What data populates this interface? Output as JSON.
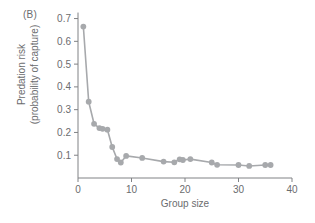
{
  "figure": {
    "panel_label": "(B)",
    "accent_color": "#a7a9ac",
    "axis_color": "#808285",
    "text_color": "#6b6c6e",
    "background": "#ffffff"
  },
  "chart_data": {
    "type": "line",
    "title": "",
    "panel": "(B)",
    "xlabel": "Group size",
    "ylabel_line1": "Predation risk",
    "ylabel_line2": "(probability of capture)",
    "xlim": [
      0,
      40
    ],
    "ylim": [
      0.0,
      0.72
    ],
    "xticks": [
      0,
      10,
      20,
      30,
      40
    ],
    "xtick_labels": [
      "0",
      "10",
      "20",
      "30",
      "40"
    ],
    "yticks": [
      0.1,
      0.2,
      0.3,
      0.4,
      0.5,
      0.6,
      0.7
    ],
    "ytick_labels": [
      "0.1",
      "0.2",
      "0.3",
      "0.4",
      "0.5",
      "0.6",
      "0.7"
    ],
    "grid": false,
    "legend": null,
    "marker": "circle",
    "series": [
      {
        "name": "Predation risk",
        "color": "#a7a9ac",
        "x": [
          1,
          2,
          3,
          4,
          4.6,
          5.5,
          6.4,
          7.3,
          8,
          9,
          12,
          16,
          18,
          19,
          19.6,
          21,
          25,
          26,
          30,
          32,
          35,
          36
        ],
        "y": [
          0.665,
          0.335,
          0.238,
          0.219,
          0.216,
          0.212,
          0.136,
          0.083,
          0.068,
          0.097,
          0.088,
          0.072,
          0.069,
          0.082,
          0.079,
          0.083,
          0.068,
          0.058,
          0.057,
          0.053,
          0.057,
          0.057
        ]
      }
    ]
  }
}
